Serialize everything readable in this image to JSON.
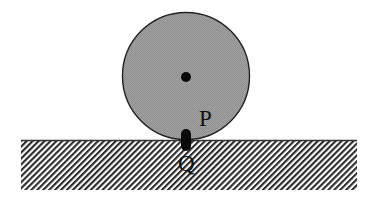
{
  "figure": {
    "type": "diagram",
    "wheel": {
      "center": [
        186,
        77
      ],
      "radius": 64,
      "fill": "#9c9c9c",
      "stroke": "#222222",
      "center_dot_radius": 5
    },
    "ground": {
      "x": 21,
      "y": 140,
      "width": 336,
      "height": 50,
      "hatch_color": "#2a2a2a",
      "surface_line_color": "#333333"
    },
    "contact_marker": {
      "x": 186,
      "y_top": 129,
      "y_bottom": 151,
      "width": 10,
      "color": "#0a0a0a"
    },
    "labels": {
      "p": "P",
      "q": "Q"
    },
    "colors": {
      "background": "#ffffff",
      "ink": "#111111"
    }
  }
}
